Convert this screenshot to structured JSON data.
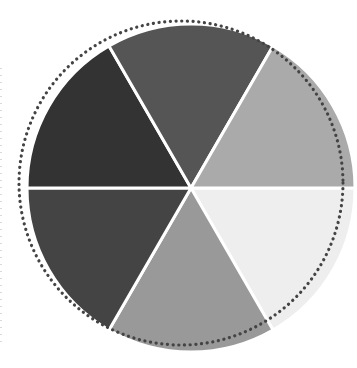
{
  "chart_data": {
    "type": "pie",
    "title": "",
    "categories": [
      "Slice 1",
      "Slice 2",
      "Slice 3",
      "Slice 4",
      "Slice 5",
      "Slice 6"
    ],
    "values": [
      1,
      1,
      1,
      1,
      1,
      1
    ],
    "start_angle_deg": 0,
    "direction": "clockwise",
    "colors": [
      "#eeeeee",
      "#999999",
      "#444444",
      "#333333",
      "#555555",
      "#aaaaaa"
    ],
    "slice_positions": [
      "lower-right",
      "bottom",
      "lower-left",
      "upper-left",
      "top",
      "upper-right"
    ],
    "separator_color": "#ffffff",
    "legend": "none",
    "decoration": {
      "dotted_ring": {
        "color": "#444444",
        "style": "dotted",
        "offset": "up-left of pie"
      },
      "left_edge_dotted_line": {
        "color": "#d9d9d9"
      }
    }
  },
  "pie": {
    "cx": 191,
    "cy": 188,
    "r": 164
  },
  "ring": {
    "cx": 181,
    "cy": 183,
    "r": 162
  }
}
